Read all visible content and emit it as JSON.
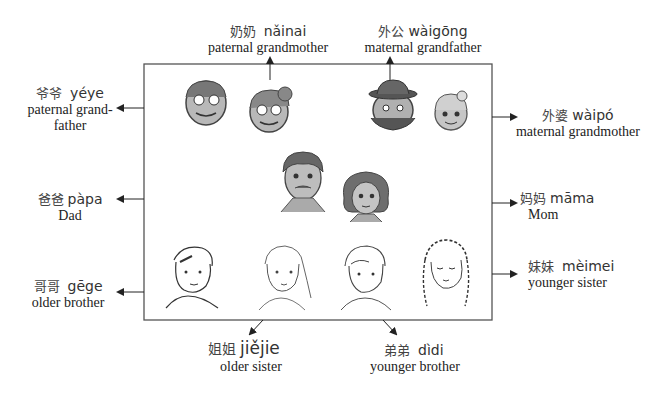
{
  "diagram": {
    "members": [
      {
        "id": "yeye",
        "chinese": "爷爷",
        "pinyin": "yéye",
        "english": "paternal grand-",
        "english2": "father"
      },
      {
        "id": "nainai",
        "chinese": "奶奶",
        "pinyin": "nǎinai",
        "english": "paternal grandmother"
      },
      {
        "id": "waigong",
        "chinese": "外公",
        "pinyin": "wàigōng",
        "english": "maternal grandfather"
      },
      {
        "id": "waipo",
        "chinese": "外婆",
        "pinyin": "wàipó",
        "english": "maternal grandmother"
      },
      {
        "id": "papa",
        "chinese": "爸爸",
        "pinyin": "pàpa",
        "english": "Dad"
      },
      {
        "id": "mama",
        "chinese": "妈妈",
        "pinyin": "māma",
        "english": "Mom"
      },
      {
        "id": "gege",
        "chinese": "哥哥",
        "pinyin": "gēge",
        "english": "older brother"
      },
      {
        "id": "meimei",
        "chinese": "妹妹",
        "pinyin": "mèimei",
        "english": "younger sister"
      },
      {
        "id": "jiejie",
        "chinese": "姐姐",
        "pinyin": "jiějie",
        "english": "older sister"
      },
      {
        "id": "didi",
        "chinese": "弟弟",
        "pinyin": "dìdi",
        "english": "younger brother"
      }
    ],
    "colors": {
      "box_border": "#555555",
      "arrow": "#222222",
      "face_fill": "#b5b5b5",
      "hair": "#666666"
    }
  }
}
